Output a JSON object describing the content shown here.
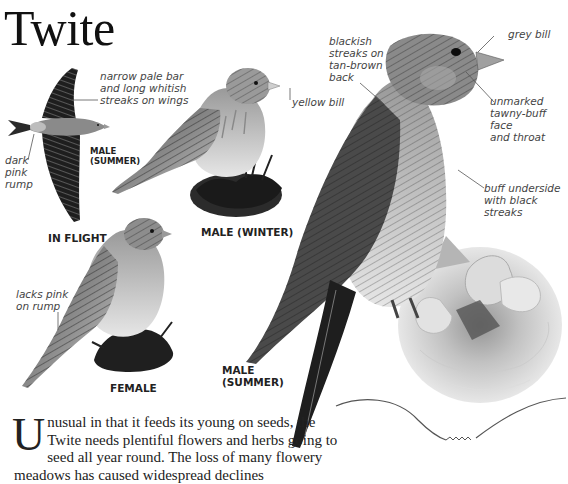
{
  "page": {
    "title": "Twite"
  },
  "figures": {
    "in_flight": {
      "caption": "IN FLIGHT",
      "sub_label": "MALE\n(SUMMER)",
      "sub_label_line1": "MALE",
      "sub_label_line2": "(SUMMER)",
      "annotations": [
        {
          "id": "wing-bar",
          "lines": [
            "narrow pale bar",
            "and long whitish",
            "streaks on wings"
          ]
        },
        {
          "id": "rump",
          "lines": [
            "dark",
            "pink",
            "rump"
          ]
        }
      ]
    },
    "male_winter": {
      "caption": "MALE (WINTER)",
      "annotations": [
        {
          "id": "bill",
          "lines": [
            "yellow bill"
          ]
        }
      ]
    },
    "female": {
      "caption": "FEMALE",
      "annotations": [
        {
          "id": "rump",
          "lines": [
            "lacks pink",
            "on rump"
          ]
        }
      ]
    },
    "male_summer": {
      "caption_line1": "MALE",
      "caption_line2": "(SUMMER)",
      "annotations": [
        {
          "id": "back",
          "lines": [
            "blackish",
            "streaks on",
            "tan-brown",
            "back"
          ]
        },
        {
          "id": "bill",
          "lines": [
            "grey bill"
          ]
        },
        {
          "id": "face",
          "lines": [
            "unmarked",
            "tawny-buff face",
            "and throat"
          ]
        },
        {
          "id": "underside",
          "lines": [
            "buff underside",
            "with black",
            "streaks"
          ]
        }
      ]
    }
  },
  "body": {
    "dropcap": "U",
    "text": "nusual in that it feeds its young on seeds, the Twite needs plentiful flowers and herbs going to seed all year round. The loss of many flowery meadows has caused widespread declines"
  }
}
